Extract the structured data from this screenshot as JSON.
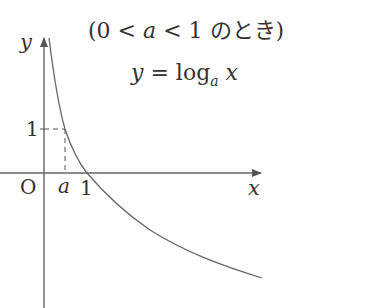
{
  "diagram": {
    "title": {
      "open": "(",
      "zero": "0",
      "lt1": " < ",
      "a": "a",
      "lt2": " < ",
      "one": "1",
      "jp": " のとき",
      "close": ")"
    },
    "equation": {
      "y": "y",
      "eq": " = log",
      "base": "a",
      "x": " x"
    },
    "axes": {
      "x_label": "x",
      "y_label": "y",
      "origin_label": "O"
    },
    "ticks": {
      "y_one": "1",
      "x_a": "a",
      "x_one": "1"
    },
    "colors": {
      "line": "#555555",
      "text": "#333333",
      "background": "#ffffff"
    }
  }
}
